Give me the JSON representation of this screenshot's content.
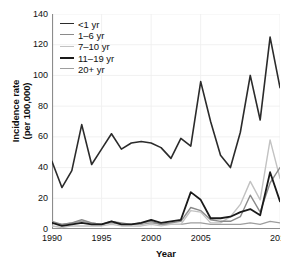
{
  "chart_data": {
    "type": "line",
    "title": "",
    "xlabel": "Year",
    "ylabel": "Incidence rate\n(per 100,000)",
    "ylabel_line1": "Incidence rate",
    "ylabel_line2": "(per 100,000)",
    "xlim": [
      1990,
      2013
    ],
    "ylim": [
      0,
      140
    ],
    "yticks": [
      0,
      20,
      40,
      60,
      80,
      100,
      120,
      140
    ],
    "xticks": [
      1990,
      1995,
      2000,
      2005,
      2013
    ],
    "xtick_labels": [
      "1990",
      "1995",
      "2000",
      "2005",
      "2013"
    ],
    "ytick_labels": [
      "0",
      "20",
      "40",
      "60",
      "80",
      "100",
      "120",
      "140"
    ],
    "grid": true,
    "legend_position": "top-left",
    "x": [
      1990,
      1991,
      1992,
      1993,
      1994,
      1995,
      1996,
      1997,
      1998,
      1999,
      2000,
      2001,
      2002,
      2003,
      2004,
      2005,
      2006,
      2007,
      2008,
      2009,
      2010,
      2011,
      2012,
      2013
    ],
    "series": [
      {
        "name": "<1 yr",
        "label": "<1 yr",
        "color": "#2b2b2b",
        "width": 1.6,
        "values": [
          44,
          27,
          38,
          68,
          42,
          52,
          62,
          52,
          56,
          57,
          56,
          53,
          46,
          59,
          54,
          96,
          70,
          48,
          40,
          63,
          100,
          71,
          125,
          92
        ]
      },
      {
        "name": "1-6 yr",
        "label": "1–6 yr",
        "color": "#8a8a8a",
        "width": 1.4,
        "values": [
          5,
          3,
          4,
          6,
          4,
          3,
          5,
          4,
          3,
          4,
          5,
          3,
          4,
          5,
          14,
          12,
          6,
          5,
          5,
          8,
          22,
          11,
          30,
          40
        ]
      },
      {
        "name": "7-10 yr",
        "label": "7–10 yr",
        "color": "#c2c2c2",
        "width": 1.4,
        "values": [
          2,
          1,
          2,
          2,
          2,
          2,
          3,
          2,
          2,
          2,
          3,
          2,
          3,
          3,
          12,
          11,
          4,
          4,
          8,
          16,
          31,
          19,
          58,
          33
        ]
      },
      {
        "name": "11-19 yr",
        "label": "11–19 yr",
        "color": "#1a1a1a",
        "width": 1.8,
        "values": [
          4,
          2,
          3,
          4,
          3,
          3,
          5,
          3,
          3,
          4,
          6,
          4,
          5,
          6,
          24,
          19,
          7,
          7,
          8,
          11,
          13,
          9,
          37,
          18
        ]
      },
      {
        "name": "20+ yr",
        "label": "20+ yr",
        "color": "#9e9e9e",
        "width": 1.2,
        "values": [
          4,
          3,
          4,
          5,
          4,
          3,
          4,
          3,
          3,
          3,
          4,
          3,
          3,
          3,
          4,
          4,
          3,
          3,
          3,
          3,
          4,
          3,
          5,
          4
        ]
      }
    ]
  },
  "legend": {
    "items": [
      {
        "label": "<1 yr",
        "color": "#2b2b2b"
      },
      {
        "label": "1–6 yr",
        "color": "#8a8a8a"
      },
      {
        "label": "7–10 yr",
        "color": "#c2c2c2"
      },
      {
        "label": "11–19 yr",
        "color": "#1a1a1a"
      },
      {
        "label": "20+ yr",
        "color": "#9e9e9e"
      }
    ]
  }
}
